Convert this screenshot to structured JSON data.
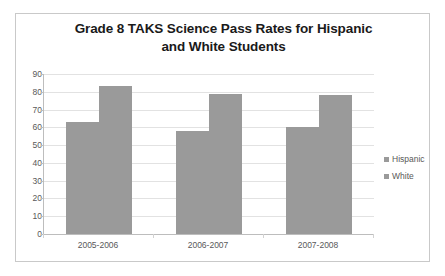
{
  "chart_data": {
    "type": "bar",
    "title": "Grade 8 TAKS Science Pass Rates for Hispanic and White Students",
    "title_line1": "Grade 8 TAKS Science Pass Rates for Hispanic",
    "title_line2": "and White Students",
    "categories": [
      "2005-2006",
      "2006-2007",
      "2007-2008"
    ],
    "series": [
      {
        "name": "Hispanic",
        "values": [
          63,
          58,
          60
        ],
        "color": "#9a9a9a"
      },
      {
        "name": "White",
        "values": [
          83.5,
          78.5,
          78
        ],
        "color": "#9a9a9a"
      }
    ],
    "xlabel": "",
    "ylabel": "",
    "ylim": [
      0,
      90
    ],
    "ytick_step": 10,
    "yticks": [
      90,
      80,
      70,
      60,
      50,
      40,
      30,
      20,
      10,
      0
    ],
    "ytick_labels": [
      "90",
      "80",
      "70",
      "60",
      "50",
      "40",
      "30",
      "20",
      "10",
      "0"
    ],
    "grid": true,
    "grid_axis": "y",
    "legend_position": "right",
    "legend_entries": [
      "Hispanic",
      "White"
    ],
    "plot_background": "#ffffff",
    "gridline_color": "#e2e2e2",
    "axis_color": "#bdbdbd",
    "text_color": "#595959",
    "title_color": "#1a1a1a",
    "border_color": "#c9c9c9"
  }
}
